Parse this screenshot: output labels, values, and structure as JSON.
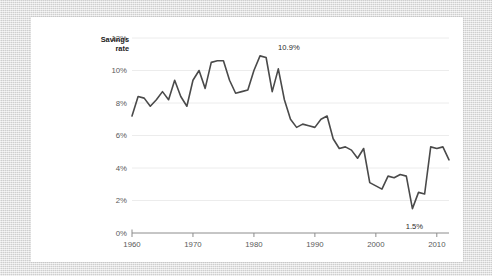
{
  "card": {
    "background_color": "#ffffff",
    "outer_background_color": "#dcdcdc"
  },
  "chart_data": {
    "type": "line",
    "title": "",
    "subtitle": "",
    "xlabel": "",
    "ylabel": "Savings rate",
    "ylabel_line1": "Savings",
    "ylabel_line2": "rate",
    "xlim": [
      1960,
      2012
    ],
    "ylim": [
      0,
      12
    ],
    "yticks": [
      0,
      2,
      4,
      6,
      8,
      10,
      12
    ],
    "ytick_labels": [
      "0%",
      "2%",
      "4%",
      "6%",
      "8%",
      "10%",
      "12%"
    ],
    "xticks": [
      1960,
      1970,
      1980,
      1990,
      2000,
      2010
    ],
    "xtick_labels": [
      "1960",
      "1970",
      "1980",
      "1990",
      "2000",
      "2010"
    ],
    "grid": true,
    "grid_axis": "y",
    "grid_color": "#ececec",
    "legend": false,
    "legend_position": "none",
    "line_color": "#4a4a4a",
    "line_width": 1.6,
    "axis_color": "#8c8c8c",
    "x": [
      1960,
      1961,
      1962,
      1963,
      1964,
      1965,
      1966,
      1967,
      1968,
      1969,
      1970,
      1971,
      1972,
      1973,
      1974,
      1975,
      1976,
      1977,
      1978,
      1979,
      1980,
      1981,
      1982,
      1983,
      1984,
      1985,
      1986,
      1987,
      1988,
      1989,
      1990,
      1991,
      1992,
      1993,
      1994,
      1995,
      1996,
      1997,
      1998,
      1999,
      2000,
      2001,
      2002,
      2003,
      2004,
      2005,
      2006,
      2007,
      2008,
      2009,
      2010,
      2011,
      2012
    ],
    "values": [
      7.2,
      8.4,
      8.3,
      7.8,
      8.2,
      8.7,
      8.2,
      9.4,
      8.4,
      7.8,
      9.4,
      10.0,
      8.9,
      10.5,
      10.6,
      10.6,
      9.4,
      8.6,
      8.7,
      8.8,
      10.0,
      10.9,
      10.8,
      8.7,
      10.1,
      8.2,
      7.0,
      6.5,
      6.7,
      6.6,
      6.5,
      7.0,
      7.2,
      5.8,
      5.2,
      5.3,
      5.1,
      4.6,
      5.2,
      3.1,
      2.9,
      2.7,
      3.5,
      3.4,
      3.6,
      3.5,
      1.5,
      2.5,
      2.4,
      5.3,
      5.2,
      5.3,
      4.5
    ],
    "annotations": [
      {
        "label": "10.9%",
        "x": 1982,
        "y": 10.9,
        "name": "peak-annotation"
      },
      {
        "label": "1.5%",
        "x": 2006,
        "y": 1.5,
        "name": "trough-annotation"
      }
    ]
  }
}
